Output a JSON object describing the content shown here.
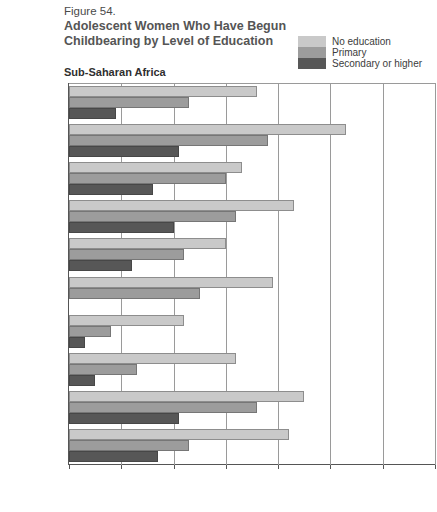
{
  "header": {
    "figure_number": "Figure 54.",
    "title_line1": "Adolescent Women Who Have Begun",
    "title_line2": "Childbearing by Level of Education"
  },
  "region_heading": "Sub-Saharan Africa",
  "legend": {
    "items": [
      {
        "label": "No education",
        "color": "#c9c9c9",
        "swatch_name": "legend-swatch-no-education"
      },
      {
        "label": "Primary",
        "color": "#9c9c9c",
        "swatch_name": "legend-swatch-primary"
      },
      {
        "label": "Secondary or higher",
        "color": "#575757",
        "swatch_name": "legend-swatch-secondary"
      }
    ]
  },
  "footnote": "",
  "chart_data": {
    "type": "bar",
    "orientation": "horizontal",
    "title": "Adolescent Women Who Have Begun Childbearing by Level of Education",
    "subtitle": "Sub-Saharan Africa",
    "xlabel": "",
    "ylabel": "",
    "xlim": [
      0,
      70
    ],
    "xticks": [
      0,
      10,
      20,
      30,
      40,
      50,
      60,
      70
    ],
    "grid": true,
    "legend_position": "top-right",
    "categories": [
      "Burkina Faso",
      "Cameroon",
      "Ghana",
      "Malawi",
      "Kenya",
      "Niger",
      "Rwanda",
      "Senegal",
      "Zambia",
      "Zimbabwe"
    ],
    "series": [
      {
        "name": "No education",
        "color": "#c9c9c9",
        "values": [
          36,
          53,
          33,
          43,
          30,
          39,
          22,
          32,
          45,
          42
        ]
      },
      {
        "name": "Primary",
        "color": "#9c9c9c",
        "values": [
          23,
          38,
          30,
          32,
          22,
          25,
          8,
          13,
          36,
          23
        ]
      },
      {
        "name": "Secondary or higher",
        "color": "#575757",
        "values": [
          9,
          21,
          16,
          20,
          12,
          0,
          3,
          5,
          21,
          17
        ]
      }
    ]
  }
}
